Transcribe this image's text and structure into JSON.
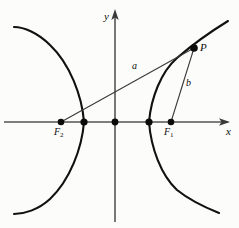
{
  "figure": {
    "kind": "hyperbola-diagram",
    "background_color": "#fcfcfa",
    "curve_color": "#111111",
    "axis_color": "#4a4a4a",
    "line_color": "#3a3a3a",
    "dot_color": "#0b0b0b"
  },
  "axes": {
    "x_label": "x",
    "y_label": "y",
    "origin": {
      "x": 115,
      "y": 122
    },
    "x_axis": {
      "x1": 4,
      "y1": 122,
      "x2": 232,
      "y2": 122
    },
    "y_axis": {
      "x1": 115,
      "y1": 222,
      "x2": 115,
      "y2": 10
    }
  },
  "points": [
    {
      "name": "focus-left",
      "label": "F",
      "sub": "2",
      "x": 61,
      "y": 122,
      "label_x": 54,
      "label_y": 127
    },
    {
      "name": "vertex-left",
      "label": "",
      "sub": "",
      "x": 84,
      "y": 122,
      "label_x": 0,
      "label_y": 0
    },
    {
      "name": "origin",
      "label": "",
      "sub": "",
      "x": 115,
      "y": 122,
      "label_x": 0,
      "label_y": 0
    },
    {
      "name": "vertex-right",
      "label": "",
      "sub": "",
      "x": 149,
      "y": 122,
      "label_x": 0,
      "label_y": 0
    },
    {
      "name": "focus-right",
      "label": "F",
      "sub": "1",
      "x": 171,
      "y": 122,
      "label_x": 164,
      "label_y": 127
    },
    {
      "name": "point-p",
      "label": "P",
      "sub": "",
      "x": 194,
      "y": 48,
      "label_x": 200,
      "label_y": 47
    }
  ],
  "segments": [
    {
      "name": "segment-a",
      "label": "a",
      "from": "focus-left",
      "to": "point-p",
      "x1": 61,
      "y1": 122,
      "x2": 194,
      "y2": 48,
      "label_x": 132,
      "label_y": 66
    },
    {
      "name": "segment-b",
      "label": "b",
      "from": "focus-right",
      "to": "point-p",
      "x1": 171,
      "y1": 122,
      "x2": 194,
      "y2": 48,
      "label_x": 186,
      "label_y": 82
    }
  ],
  "curves": [
    {
      "name": "left-branch",
      "vertex": {
        "x": 84,
        "y": 122
      },
      "upper_end": {
        "x": 14,
        "y": 27
      },
      "lower_end": {
        "x": 14,
        "y": 214
      }
    },
    {
      "name": "right-branch",
      "vertex": {
        "x": 149,
        "y": 122
      },
      "upper_end": {
        "x": 228,
        "y": 21
      },
      "lower_end": {
        "x": 219,
        "y": 213
      }
    }
  ]
}
